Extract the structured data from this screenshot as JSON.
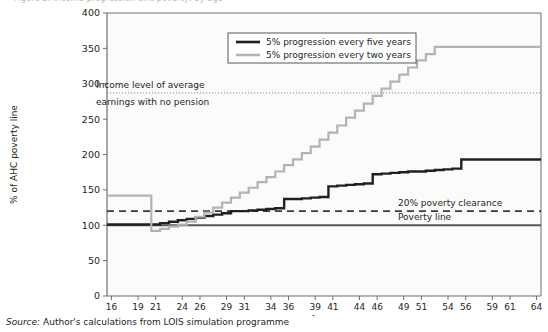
{
  "figure": {
    "clipped_caption": "Figure 2: Income progression and poverty, by age",
    "source_prefix": "Source:",
    "source_text": "Author's calculations from LOIS simulation programme"
  },
  "colors": {
    "series_five_years": "#231f20",
    "series_two_years": "#b3b3b3",
    "axis": "#6d6e71",
    "poverty_line": "#58595b",
    "clearance_line": "#3a3a3a",
    "income_line": "#8c8c8c",
    "plot_background": "#fbfbfb"
  },
  "legend": {
    "position": "top-center",
    "entries": [
      {
        "label": "5% progression every five years",
        "color": "#231f20"
      },
      {
        "label": "5% progression every two years",
        "color": "#b3b3b3"
      }
    ]
  },
  "annotations": [
    {
      "name": "income-level-note",
      "line1": "Income level of average",
      "line2": "earnings with no pension",
      "value": 287
    },
    {
      "name": "clearance-note",
      "text": "20% poverty clearance",
      "value": 120
    },
    {
      "name": "poverty-line-note",
      "text": "Poverty line",
      "value": 100
    }
  ],
  "chart_data": {
    "type": "line",
    "title": "",
    "xlabel": "Age",
    "ylabel": "% of AHC poverty line",
    "xlim": [
      16,
      65
    ],
    "ylim": [
      0,
      400
    ],
    "grid": false,
    "ytick_values": [
      0,
      50,
      100,
      150,
      200,
      250,
      300,
      350,
      400
    ],
    "ytick_labels": [
      "0",
      "50",
      "100",
      "150",
      "200",
      "250",
      "300",
      "350",
      "400"
    ],
    "xtick_labels": [
      "16",
      "19",
      "21",
      "24",
      "26",
      "29",
      "31",
      "34",
      "36",
      "39",
      "41",
      "44",
      "46",
      "49",
      "51",
      "54",
      "56",
      "59",
      "61",
      "64"
    ],
    "xtick_values": [
      16,
      19,
      21,
      24,
      26,
      29,
      31,
      34,
      36,
      39,
      41,
      44,
      46,
      49,
      51,
      54,
      56,
      59,
      61,
      64
    ],
    "reference_lines": [
      {
        "name": "income-level-average-earnings",
        "value": 287,
        "style": "dotted",
        "color": "#8c8c8c"
      },
      {
        "name": "20-percent-poverty-clearance",
        "value": 120,
        "style": "dashed",
        "color": "#3a3a3a"
      },
      {
        "name": "poverty-line",
        "value": 100,
        "style": "solid",
        "color": "#58595b"
      }
    ],
    "series": [
      {
        "name": "5% progression every five years",
        "color": "#231f20",
        "step": "post",
        "x": [
          16,
          17,
          18,
          19,
          20,
          21,
          22,
          23,
          24,
          25,
          26,
          27,
          28,
          29,
          30,
          31,
          32,
          33,
          34,
          35,
          36,
          37,
          38,
          39,
          40,
          41,
          42,
          43,
          44,
          45,
          46,
          47,
          48,
          49,
          50,
          51,
          52,
          53,
          54,
          55,
          56,
          57,
          58,
          59,
          60,
          61,
          62,
          63,
          64,
          65
        ],
        "values": [
          101,
          101,
          101,
          101,
          101,
          101,
          103,
          105,
          107,
          109,
          111,
          113,
          115,
          117,
          120,
          120,
          121,
          122,
          123,
          124,
          137,
          137,
          138,
          139,
          140,
          155,
          156,
          157,
          158,
          159,
          172,
          173,
          174,
          175,
          176,
          176,
          177,
          178,
          179,
          180,
          193,
          193,
          193,
          193,
          193,
          193,
          193,
          193,
          193,
          193
        ]
      },
      {
        "name": "5% progression every two years",
        "color": "#b3b3b3",
        "step": "post",
        "x": [
          16,
          17,
          18,
          19,
          20,
          21,
          22,
          23,
          24,
          25,
          26,
          27,
          28,
          29,
          30,
          31,
          32,
          33,
          34,
          35,
          36,
          37,
          38,
          39,
          40,
          41,
          42,
          43,
          44,
          45,
          46,
          47,
          48,
          49,
          50,
          51,
          52,
          53,
          54,
          55,
          56,
          57,
          58,
          59,
          60,
          61,
          62,
          63,
          64,
          65
        ],
        "values": [
          142,
          142,
          142,
          142,
          142,
          92,
          95,
          98,
          101,
          105,
          112,
          118,
          125,
          132,
          139,
          146,
          153,
          161,
          168,
          176,
          185,
          193,
          202,
          211,
          221,
          231,
          241,
          252,
          262,
          272,
          283,
          293,
          303,
          313,
          323,
          333,
          342,
          352,
          352,
          352,
          352,
          352,
          352,
          352,
          352,
          352,
          352,
          352,
          352,
          352
        ]
      }
    ]
  }
}
